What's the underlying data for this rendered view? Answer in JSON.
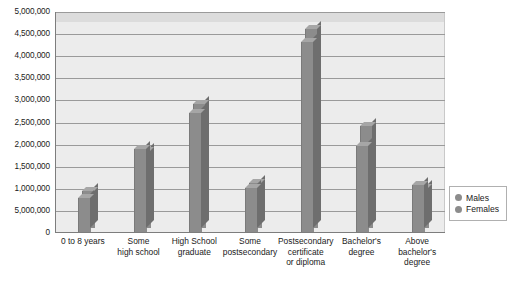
{
  "chart_data": {
    "type": "bar",
    "title": "",
    "xlabel": "",
    "ylabel": "",
    "ylim": [
      0,
      5000000
    ],
    "grid": true,
    "legend_position": "right",
    "categories": [
      "0 to 8 years",
      "Some high school",
      "High School graduate",
      "Some postsecondary",
      "Postsecondary certificate or diploma",
      "Bachelor's degree",
      "Above bachelor's degree"
    ],
    "category_lines": [
      [
        "0 to 8 years"
      ],
      [
        "Some",
        "high school"
      ],
      [
        "High School",
        "graduate"
      ],
      [
        "Some",
        "postsecondary"
      ],
      [
        "Postsecondary",
        "certificate",
        "or diploma"
      ],
      [
        "Bachelor's",
        "degree"
      ],
      [
        "Above",
        "bachelor's",
        "degree"
      ]
    ],
    "series": [
      {
        "name": "Males",
        "color": "#8c8c8c",
        "values": [
          780000,
          1870000,
          2700000,
          1000000,
          4300000,
          1950000,
          1060000
        ]
      },
      {
        "name": "Females",
        "color": "#8c8c8c",
        "values": [
          830000,
          1740000,
          2810000,
          1020000,
          4500000,
          2300000,
          900000
        ]
      }
    ],
    "y_ticks": [
      {
        "value": 5000000,
        "label": "5,000,000"
      },
      {
        "value": 4500000,
        "label": "4,500,000"
      },
      {
        "value": 4000000,
        "label": "4,000,000"
      },
      {
        "value": 3500000,
        "label": "3,500,000"
      },
      {
        "value": 3000000,
        "label": "3,000,000"
      },
      {
        "value": 2500000,
        "label": "2,500,000"
      },
      {
        "value": 2000000,
        "label": "2,000,000"
      },
      {
        "value": 1500000,
        "label": "1,500,000"
      },
      {
        "value": 1000000,
        "label": "1,000,000"
      },
      {
        "value": 500000,
        "label": "5,000,000"
      },
      {
        "value": 0,
        "label": "0"
      }
    ]
  },
  "legend": {
    "items": [
      {
        "label": "Males"
      },
      {
        "label": "Females"
      }
    ]
  }
}
